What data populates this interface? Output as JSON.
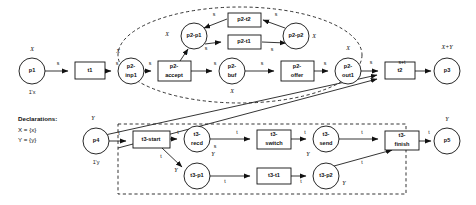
{
  "diagram": {
    "declarations": {
      "heading": "Declarations:",
      "lines": [
        "X = {x}",
        "Y = {y}"
      ]
    },
    "colors": {
      "stroke": "#111111",
      "fill": "#ffffff",
      "boundary": "#111111"
    },
    "places": [
      {
        "id": "p1",
        "label": "p1",
        "type": "X",
        "marking": "1'x",
        "cx": 32,
        "cy": 71,
        "r": 13
      },
      {
        "id": "p2-inp1",
        "label": "p2-\ninp1",
        "line1": "p2-",
        "line2": "inp1",
        "type": "X",
        "cx": 131,
        "cy": 71,
        "r": 13
      },
      {
        "id": "p2-p1",
        "label": "p2-p1",
        "line1": "p2-p1",
        "line2": "",
        "type": "X",
        "cx": 194,
        "cy": 36,
        "r": 13
      },
      {
        "id": "p2-buf",
        "label": "p2-\nbuf",
        "line1": "p2-",
        "line2": "buf",
        "type": "X",
        "cx": 232,
        "cy": 71,
        "r": 13
      },
      {
        "id": "p2-p2",
        "label": "p2-p2",
        "line1": "p2-p2",
        "line2": "",
        "type": "X",
        "cx": 296,
        "cy": 36,
        "r": 13
      },
      {
        "id": "p2-out1",
        "label": "p2-\nout1",
        "line1": "p2-",
        "line2": "out1",
        "type": "X",
        "cx": 348,
        "cy": 71,
        "r": 13
      },
      {
        "id": "p3",
        "label": "p3",
        "type": "X+Y",
        "cx": 447,
        "cy": 71,
        "r": 13
      },
      {
        "id": "p4",
        "label": "p4",
        "type": "Y",
        "marking": "1'y",
        "cx": 96,
        "cy": 141,
        "r": 13
      },
      {
        "id": "t3-recd",
        "label": "t3-\nrecd",
        "line1": "t3-",
        "line2": "recd",
        "type": "Y",
        "cx": 197,
        "cy": 139,
        "r": 13
      },
      {
        "id": "t3-p1",
        "label": "t3-p1",
        "line1": "t3-p1",
        "line2": "",
        "type": "Y",
        "cx": 197,
        "cy": 176,
        "r": 13
      },
      {
        "id": "t3-send",
        "label": "t3-\nsend",
        "line1": "t3-",
        "line2": "send",
        "type": "Y",
        "cx": 326,
        "cy": 139,
        "r": 13
      },
      {
        "id": "t3-p2",
        "label": "t3-p2",
        "line1": "t3-p2",
        "line2": "",
        "type": "Y",
        "cx": 326,
        "cy": 176,
        "r": 13
      },
      {
        "id": "p5",
        "label": "p5",
        "type": "Y",
        "cx": 447,
        "cy": 141,
        "r": 13
      }
    ],
    "transitions": [
      {
        "id": "t1",
        "label": "t1",
        "x": 75,
        "y": 62,
        "w": 30,
        "h": 17
      },
      {
        "id": "p2-accept",
        "label": "p2-\naccept",
        "line1": "p2-",
        "line2": "accept",
        "x": 158,
        "y": 61,
        "w": 33,
        "h": 20
      },
      {
        "id": "p2-t2",
        "label": "p2-t2",
        "line1": "p2-t2",
        "line2": "",
        "x": 228,
        "y": 13,
        "w": 33,
        "h": 14
      },
      {
        "id": "p2-t1",
        "label": "p2-t1",
        "line1": "p2-t1",
        "line2": "",
        "x": 228,
        "y": 35,
        "w": 33,
        "h": 14
      },
      {
        "id": "p2-offer",
        "label": "p2-\noffer",
        "line1": "p2-",
        "line2": "offer",
        "x": 281,
        "y": 61,
        "w": 33,
        "h": 20
      },
      {
        "id": "t2",
        "label": "t2",
        "x": 385,
        "y": 62,
        "w": 30,
        "h": 17
      },
      {
        "id": "t3-start",
        "label": "t3-start",
        "line1": "t3-start",
        "line2": "",
        "x": 133,
        "y": 131,
        "w": 37,
        "h": 17
      },
      {
        "id": "t3-switch",
        "label": "t3-\nswitch",
        "line1": "t3-",
        "line2": "switch",
        "x": 257,
        "y": 130,
        "w": 34,
        "h": 19
      },
      {
        "id": "t3-t1",
        "label": "t3-t1",
        "line1": "t3-t1",
        "line2": "",
        "x": 257,
        "y": 168,
        "w": 34,
        "h": 16
      },
      {
        "id": "t3-finish",
        "label": "t3-\nfinish",
        "line1": "t3-",
        "line2": "finish",
        "x": 385,
        "y": 131,
        "w": 34,
        "h": 19
      }
    ],
    "arc_labels": [
      {
        "id": "a1",
        "text": "s",
        "x": 58,
        "y": 64
      },
      {
        "id": "a2",
        "text": "s",
        "x": 117,
        "y": 64
      },
      {
        "id": "a3",
        "text": "s",
        "x": 150,
        "y": 64
      },
      {
        "id": "a4",
        "text": "s",
        "x": 186,
        "y": 53
      },
      {
        "id": "a5",
        "text": "s",
        "x": 215,
        "y": 64
      },
      {
        "id": "a6",
        "text": "s",
        "x": 214,
        "y": 15
      },
      {
        "id": "a7",
        "text": "s",
        "x": 206,
        "y": 44
      },
      {
        "id": "a8",
        "text": "s",
        "x": 276,
        "y": 15
      },
      {
        "id": "a9",
        "text": "s",
        "x": 281,
        "y": 44
      },
      {
        "id": "a10",
        "text": "s",
        "x": 270,
        "y": 64
      },
      {
        "id": "a11",
        "text": "s",
        "x": 331,
        "y": 64
      },
      {
        "id": "a12",
        "text": "s",
        "x": 373,
        "y": 63
      },
      {
        "id": "a13",
        "text": "s+t",
        "x": 402,
        "y": 63
      },
      {
        "id": "b1",
        "text": "t",
        "x": 119,
        "y": 134
      },
      {
        "id": "b2",
        "text": "t",
        "x": 178,
        "y": 133
      },
      {
        "id": "b3",
        "text": "t",
        "x": 161,
        "y": 157
      },
      {
        "id": "b4",
        "text": "s",
        "x": 215,
        "y": 147
      },
      {
        "id": "b5",
        "text": "t",
        "x": 237,
        "y": 133
      },
      {
        "id": "b6",
        "text": "t",
        "x": 214,
        "y": 181
      },
      {
        "id": "b7",
        "text": "t",
        "x": 305,
        "y": 133
      },
      {
        "id": "b8",
        "text": "t",
        "x": 304,
        "y": 181
      },
      {
        "id": "b9",
        "text": "t",
        "x": 362,
        "y": 133
      },
      {
        "id": "b10",
        "text": "t",
        "x": 358,
        "y": 163
      },
      {
        "id": "b11",
        "text": "t",
        "x": 429,
        "y": 133
      }
    ],
    "type_annotations": [
      {
        "id": "ta1",
        "text": "X",
        "x": 32,
        "y": 50
      },
      {
        "id": "ta2",
        "text": "X",
        "x": 118,
        "y": 52
      },
      {
        "id": "ta3",
        "text": "X",
        "x": 151,
        "y": 35
      },
      {
        "id": "ta4",
        "text": "X",
        "x": 232,
        "y": 94
      },
      {
        "id": "ta5",
        "text": "X",
        "x": 315,
        "y": 36
      },
      {
        "id": "ta6",
        "text": "X",
        "x": 348,
        "y": 48
      },
      {
        "id": "ta7",
        "text": "X+Y",
        "x": 447,
        "y": 48
      },
      {
        "id": "ta8",
        "text": "Y",
        "x": 93,
        "y": 119
      },
      {
        "id": "ta9",
        "text": "Y",
        "x": 212,
        "y": 155
      },
      {
        "id": "ta10",
        "text": "Y",
        "x": 176,
        "y": 176
      },
      {
        "id": "ta11",
        "text": "Y",
        "x": 309,
        "y": 155
      },
      {
        "id": "ta12",
        "text": "Y",
        "x": 343,
        "y": 186
      },
      {
        "id": "ta13",
        "text": "Y",
        "x": 447,
        "y": 120
      }
    ],
    "markings": [
      {
        "id": "m1",
        "text": "1'x",
        "x": 32,
        "y": 93
      },
      {
        "id": "m2",
        "text": "1'y",
        "x": 96,
        "y": 163
      }
    ],
    "boundaries": [
      {
        "id": "module-p2",
        "shape": "ellipse",
        "cx": 240,
        "cy": 55,
        "rx": 122,
        "ry": 48
      },
      {
        "id": "module-t3",
        "shape": "rect",
        "x": 118,
        "y": 124,
        "w": 288,
        "h": 70
      }
    ]
  }
}
